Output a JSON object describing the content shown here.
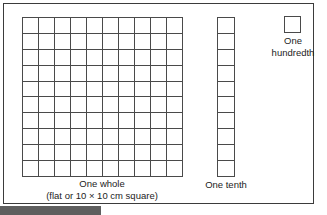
{
  "figure": {
    "background_color": "#ffffff",
    "frame_color": "#3b3b3b",
    "line_color": "#4a4a4a",
    "text_color": "#1c1c1c",
    "footer_bar_color": "#5e5e5e"
  },
  "models": {
    "whole": {
      "label": "One whole",
      "sublabel": "(flat or 10 × 10 cm square)",
      "columns": 10,
      "rows": 10,
      "cell_count": 100,
      "value": "1"
    },
    "tenth": {
      "label": "One tenth",
      "columns": 1,
      "rows": 10,
      "cell_count": 10,
      "value": "0.1"
    },
    "hundredth": {
      "label_line1": "One",
      "label_line2": "hundredth",
      "columns": 1,
      "rows": 1,
      "cell_count": 1,
      "value": "0.01"
    }
  }
}
